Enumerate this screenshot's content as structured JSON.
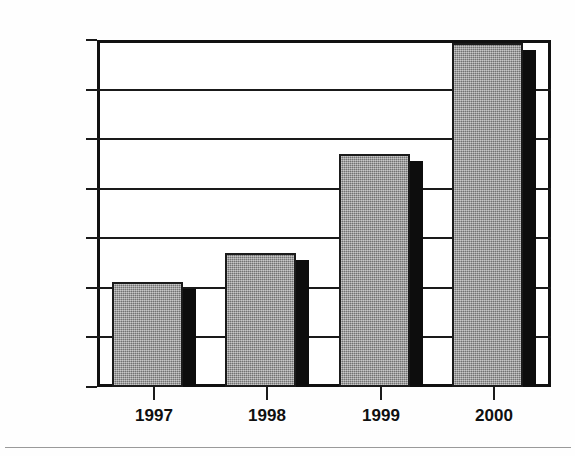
{
  "chart_data": {
    "type": "bar",
    "title": "",
    "title_note": "title cropped off at top edge, illegible",
    "xlabel": "",
    "ylabel": "",
    "categories": [
      "1997",
      "1998",
      "1999",
      "2000"
    ],
    "values": [
      7060,
      7350,
      8350,
      9470
    ],
    "ylim": [
      6000,
      9500
    ],
    "ytick_labels": [
      "9,500",
      "9,000",
      "8,500",
      "8,000",
      "7,500",
      "7,000",
      "6,500",
      "6,000"
    ],
    "ytick_values": [
      9500,
      9000,
      8500,
      8000,
      7500,
      7000,
      6500,
      6000
    ],
    "grid": true,
    "legend": null,
    "series": [
      {
        "name": "",
        "values": [
          7060,
          7350,
          8350,
          9470
        ]
      }
    ],
    "style": {
      "bar_fill": "#8d8d8d",
      "bar_border": "#1b1b1b",
      "bar_shadow": "#0d0d0d",
      "axis_color": "#1a1a1a",
      "background": "#ffffff"
    }
  }
}
